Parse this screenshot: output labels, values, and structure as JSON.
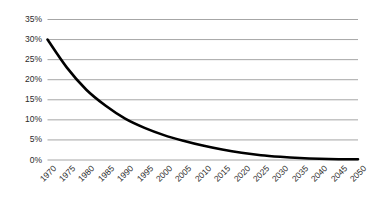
{
  "chart_data": {
    "type": "line",
    "title": "",
    "subtitle": "",
    "xlabel": "",
    "ylabel": "",
    "x": [
      1970,
      1975,
      1980,
      1985,
      1990,
      1995,
      2000,
      2005,
      2010,
      2015,
      2020,
      2025,
      2030,
      2035,
      2040,
      2045,
      2050
    ],
    "series": [
      {
        "name": "",
        "values": [
          30.0,
          23.0,
          17.5,
          13.5,
          10.3,
          8.0,
          6.2,
          4.8,
          3.6,
          2.6,
          1.8,
          1.2,
          0.8,
          0.5,
          0.3,
          0.2,
          0.2
        ]
      }
    ],
    "categories": [
      "1970",
      "1975",
      "1980",
      "1985",
      "1990",
      "1995",
      "2000",
      "2005",
      "2010",
      "2015",
      "2020",
      "2025",
      "2030",
      "2035",
      "2040",
      "2045",
      "2050"
    ],
    "ylim": [
      0,
      35
    ],
    "yticks": [
      0,
      5,
      10,
      15,
      20,
      25,
      30,
      35
    ],
    "ytick_labels": [
      "0%",
      "5%",
      "10%",
      "15%",
      "20%",
      "25%",
      "30%",
      "35%"
    ],
    "xlim": [
      1970,
      2050
    ],
    "grid": true,
    "grid_axis": "y",
    "legend": false,
    "legend_position": "none",
    "line_color": "#000000",
    "grid_color": "#a6a6a6",
    "background_color": "#ffffff",
    "line_width": 2.6
  },
  "axes": {
    "y_tick_labels": [
      "35%",
      "30%",
      "25%",
      "20%",
      "15%",
      "10%",
      "5%",
      "0%"
    ],
    "x_tick_labels": [
      "1970",
      "1975",
      "1980",
      "1985",
      "1990",
      "1995",
      "2000",
      "2005",
      "2010",
      "2015",
      "2020",
      "2025",
      "2030",
      "2035",
      "2040",
      "2045",
      "2050"
    ]
  }
}
